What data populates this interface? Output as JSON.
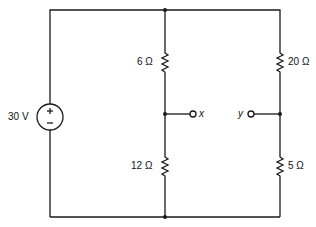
{
  "diagram": {
    "type": "circuit",
    "source": {
      "label": "30 V",
      "plus": "+",
      "minus": "−"
    },
    "resistors": [
      {
        "id": "r6",
        "label": "6 Ω"
      },
      {
        "id": "r12",
        "label": "12 Ω"
      },
      {
        "id": "r20",
        "label": "20 Ω"
      },
      {
        "id": "r5",
        "label": "5 Ω"
      }
    ],
    "terminals": [
      {
        "id": "x",
        "label": "x"
      },
      {
        "id": "y",
        "label": "y"
      }
    ],
    "colors": {
      "wire": "#1a1a1a",
      "background": "#ffffff"
    }
  }
}
